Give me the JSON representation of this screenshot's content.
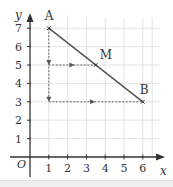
{
  "chart_data": {
    "type": "line",
    "title": "",
    "xlabel": "x",
    "ylabel": "y",
    "origin_label": "O",
    "xlim": [
      0,
      6
    ],
    "ylim": [
      0,
      7
    ],
    "x_ticks": [
      "1",
      "2",
      "3",
      "4",
      "5",
      "6"
    ],
    "y_ticks": [
      "1",
      "2",
      "3",
      "4",
      "5",
      "6",
      "7"
    ],
    "grid": true,
    "points": [
      {
        "label": "A",
        "x": 1,
        "y": 7
      },
      {
        "label": "M",
        "x": 3.5,
        "y": 5
      },
      {
        "label": "B",
        "x": 6,
        "y": 3
      }
    ],
    "segment": {
      "from": "A",
      "to": "B"
    },
    "dashed_guides": [
      {
        "from": [
          1,
          7
        ],
        "to": [
          1,
          3
        ],
        "note": "vertical drop from A with arrows at y=5 and y=3"
      },
      {
        "from": [
          1,
          5
        ],
        "to": [
          3.5,
          5
        ],
        "note": "horizontal guide to M"
      },
      {
        "from": [
          1,
          3
        ],
        "to": [
          6,
          3
        ],
        "note": "horizontal guide to B"
      }
    ]
  },
  "colors": {
    "grid": "#dcdcdc",
    "axis": "#333333",
    "segment": "#555555",
    "guide": "#555555",
    "band": "#efefef"
  }
}
